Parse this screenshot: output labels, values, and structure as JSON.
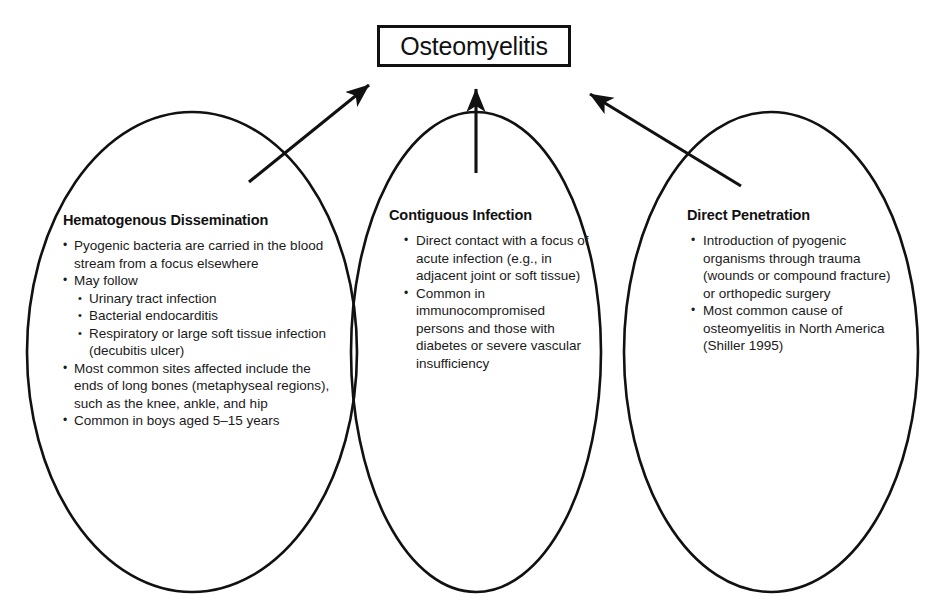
{
  "diagram": {
    "title": "Osteomyelitis",
    "title_box": {
      "label": "Osteomyelitis"
    },
    "groups": [
      {
        "id": "hematogenous-dissemination",
        "heading": "Hematogenous Dissemination",
        "bullets": [
          {
            "level": 1,
            "text": "Pyogenic bacteria are carried in the blood stream from a focus elsewhere"
          },
          {
            "level": 1,
            "text": "May follow"
          },
          {
            "level": 2,
            "text": "Urinary tract infection"
          },
          {
            "level": 2,
            "text": "Bacterial endocarditis"
          },
          {
            "level": 2,
            "text": "Respiratory or large soft tissue infection (decubitis ulcer)"
          },
          {
            "level": 1,
            "text": "Most common sites affected include the ends of long bones (metaphyseal regions), such as the knee, ankle, and hip"
          },
          {
            "level": 1,
            "text": "Common in boys aged 5–15 years"
          }
        ]
      },
      {
        "id": "contiguous-infection",
        "heading": "Contiguous Infection",
        "bullets": [
          {
            "level": 1,
            "text": "Direct contact with a focus of acute infection (e.g., in adjacent joint or soft tissue)"
          },
          {
            "level": 1,
            "text": "Common in immunocompromised persons and those with diabetes or severe vascular insufficiency"
          }
        ]
      },
      {
        "id": "direct-penetration",
        "heading": "Direct Penetration",
        "bullets": [
          {
            "level": 1,
            "text": "Introduction of pyogenic organisms through trauma (wounds or compound fracture) or orthopedic surgery"
          },
          {
            "level": 1,
            "text": "Most common cause of osteomyelitis in North America (Shiller 1995)"
          }
        ]
      }
    ],
    "arrows": [
      {
        "id": "arrow-hematogenous-to-title",
        "direction": "up-right"
      },
      {
        "id": "arrow-contiguous-to-title",
        "direction": "up"
      },
      {
        "id": "arrow-direct-to-title",
        "direction": "up-left"
      }
    ],
    "colors": {
      "stroke": "#111111",
      "text": "#1a1a1a",
      "background": "#ffffff"
    }
  }
}
